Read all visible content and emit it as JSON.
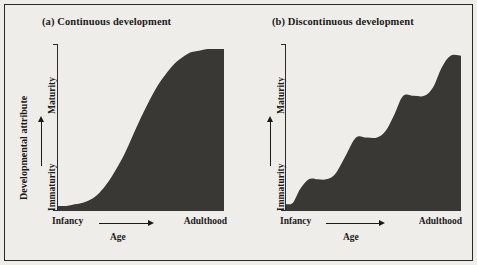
{
  "figure": {
    "background_color": "#efedea",
    "ink_color": "#1b1a19",
    "fill_color": "#3a3835",
    "border_color": "#2b2a28"
  },
  "panels": [
    {
      "id": "a",
      "title": "(a) Continuous development",
      "outer_axis_label": "Developmental attribute",
      "y_axis": {
        "low": "Immaturity",
        "high": "Maturity"
      },
      "x_axis": {
        "low": "Infancy",
        "high": "Adulthood",
        "name": "Age"
      }
    },
    {
      "id": "b",
      "title": "(b) Discontinuous development",
      "outer_axis_label": "",
      "y_axis": {
        "low": "Immaturity",
        "high": "Maturity"
      },
      "x_axis": {
        "low": "Infancy",
        "high": "Adulthood",
        "name": "Age"
      }
    }
  ],
  "chart_data": [
    {
      "type": "area",
      "title": "(a) Continuous development",
      "xlabel": "Age",
      "ylabel": "Developmental attribute",
      "x_tick_labels": [
        "Infancy",
        "Adulthood"
      ],
      "y_tick_labels": [
        "Immaturity",
        "Maturity"
      ],
      "xlim": [
        0,
        100
      ],
      "ylim": [
        0,
        100
      ],
      "grid": false,
      "legend": "none",
      "series": [
        {
          "name": "Continuous growth (sigmoid)",
          "x": [
            0,
            5,
            10,
            15,
            20,
            25,
            30,
            35,
            40,
            45,
            50,
            55,
            60,
            65,
            70,
            75,
            80,
            85,
            90,
            95,
            100
          ],
          "values": [
            3,
            3,
            4,
            5,
            7,
            11,
            17,
            25,
            34,
            45,
            56,
            66,
            75,
            82,
            88,
            92,
            95,
            96,
            97,
            97,
            97
          ]
        }
      ]
    },
    {
      "type": "area",
      "title": "(b) Discontinuous development",
      "xlabel": "Age",
      "ylabel": "Developmental attribute",
      "x_tick_labels": [
        "Infancy",
        "Adulthood"
      ],
      "y_tick_labels": [
        "Immaturity",
        "Maturity"
      ],
      "xlim": [
        0,
        100
      ],
      "ylim": [
        0,
        100
      ],
      "grid": false,
      "legend": "none",
      "stages": [
        {
          "name": "Stage 1 plateau",
          "x_start": 5,
          "x_end": 23,
          "level": 19
        },
        {
          "name": "Stage 2 plateau",
          "x_start": 40,
          "x_end": 52,
          "level": 44
        },
        {
          "name": "Stage 3 plateau",
          "x_start": 66,
          "x_end": 79,
          "level": 69
        },
        {
          "name": "Stage 4 plateau",
          "x_start": 91,
          "x_end": 100,
          "level": 93
        }
      ],
      "series": [
        {
          "name": "Discontinuous growth (stages)",
          "x": [
            0,
            4,
            8,
            13,
            18,
            23,
            28,
            34,
            40,
            46,
            52,
            57,
            62,
            67,
            73,
            79,
            84,
            89,
            94,
            100
          ],
          "values": [
            4,
            5,
            13,
            19,
            19,
            19,
            22,
            33,
            44,
            44,
            44,
            48,
            58,
            69,
            69,
            69,
            74,
            86,
            93,
            93
          ]
        }
      ]
    }
  ]
}
